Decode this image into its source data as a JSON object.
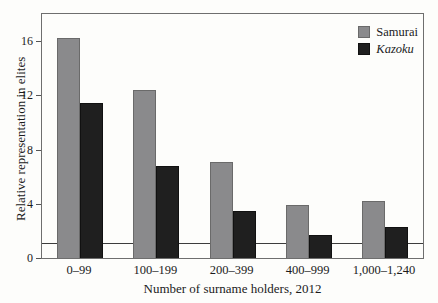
{
  "chart_data": {
    "type": "bar",
    "title": "",
    "xlabel": "Number of surname holders, 2012",
    "ylabel": "Relative representation in elites",
    "categories": [
      "0–99",
      "100–199",
      "200–399",
      "400–999",
      "1,000–1,240"
    ],
    "series": [
      {
        "name": "Samurai",
        "color": "#8a8a8c",
        "border": "#6a6a6a",
        "italic": false,
        "values": [
          16.2,
          12.4,
          7.1,
          3.9,
          4.2
        ]
      },
      {
        "name": "Kazoku",
        "color": "#1f1f1f",
        "border": "#111111",
        "italic": true,
        "values": [
          11.4,
          6.8,
          3.5,
          1.7,
          2.3
        ]
      }
    ],
    "ylim": [
      0,
      18
    ],
    "yticks": [
      0,
      4,
      8,
      12,
      16
    ],
    "reference_line": 1,
    "legend_position": "top-right",
    "grid": false
  },
  "colors": {
    "background": "#fdfdfb",
    "plot_border": "#6e6e6e",
    "reference_line": "#3c3c3c",
    "text": "#1b1b1b"
  }
}
